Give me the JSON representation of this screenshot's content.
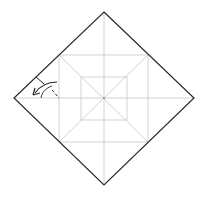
{
  "diagram": {
    "type": "origami-fold-diagram",
    "colors": {
      "background": "#ffffff",
      "edge": "#2a2a2a",
      "crease": "#c8c8c8",
      "arrow": "#222222"
    },
    "paper": {
      "shape": "diamond",
      "vertices": {
        "top": [
          104,
          12
        ],
        "right": [
          194,
          98
        ],
        "bottom": [
          104,
          185
        ],
        "left": [
          14,
          98
        ]
      }
    },
    "creases": {
      "outer_square": {
        "x1": 59,
        "y1": 55,
        "x2": 148,
        "y2": 142
      },
      "inner_square": {
        "x1": 81,
        "y1": 77,
        "x2": 127,
        "y2": 120
      },
      "center": [
        104,
        98
      ]
    },
    "fold_indicator": {
      "description": "valley fold arrow pointing toward left corner",
      "fold_line": {
        "from": [
          36,
          77
        ],
        "to": [
          60,
          98
        ]
      },
      "arrow_direction": "left"
    }
  }
}
